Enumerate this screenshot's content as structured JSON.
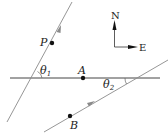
{
  "diagram": {
    "points": {
      "P": {
        "label": "P",
        "x": 52,
        "y": 43
      },
      "A": {
        "label": "A",
        "x": 83,
        "y": 78
      },
      "B": {
        "label": "B",
        "x": 70,
        "y": 116
      }
    },
    "angles": {
      "theta1": {
        "symbol": "θ",
        "subscript": "1"
      },
      "theta2": {
        "symbol": "θ",
        "subscript": "2"
      }
    },
    "compass": {
      "north_label": "N",
      "east_label": "E"
    },
    "colors": {
      "horizontal_line": "#444444",
      "slanted_lines": "#8a8a8a",
      "points": "#111111",
      "text": "#222222"
    }
  }
}
